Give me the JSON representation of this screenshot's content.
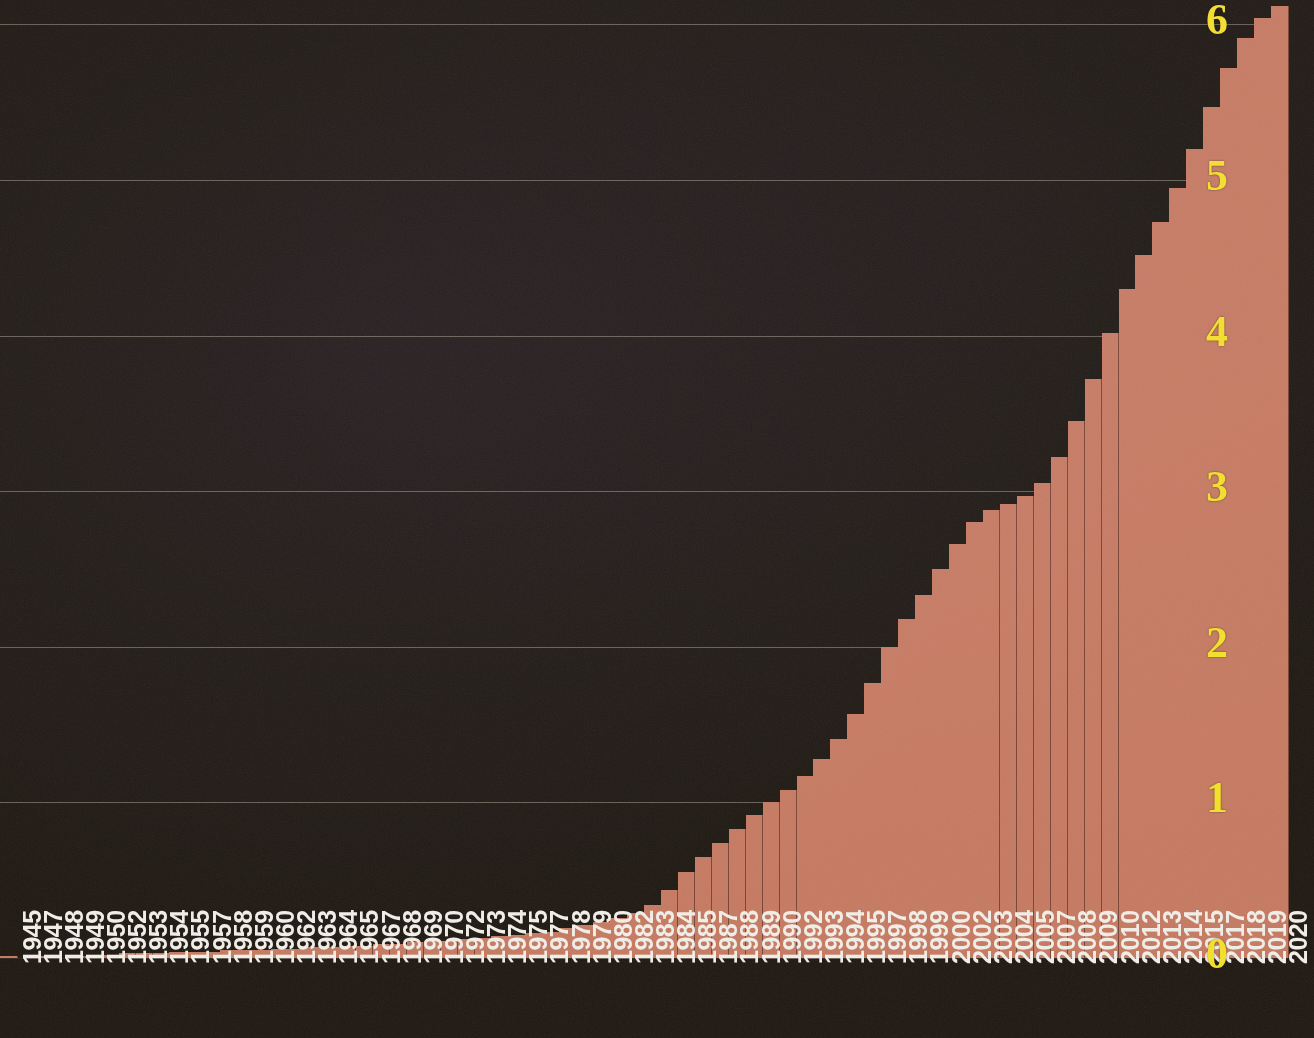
{
  "chart_data": {
    "type": "bar",
    "title": "",
    "subtitle": "",
    "xlabel": "",
    "ylabel": "",
    "ylim": [
      0,
      6.3
    ],
    "y_ticks": [
      0,
      1,
      2,
      3,
      4,
      5,
      6
    ],
    "y_tick_labels": [
      "0",
      "1",
      "2",
      "3",
      "4",
      "5",
      "6"
    ],
    "grid": true,
    "grid_axis": "y",
    "legend": "none",
    "bar_color": "#c67a61",
    "axis_label_color_y": "#f5e028",
    "axis_label_color_x": "#f2efe9",
    "background_color": "#1e1811",
    "x_tick_labels": [
      "1945",
      "1947",
      "1948",
      "1949",
      "1950",
      "1952",
      "1953",
      "1954",
      "1955",
      "1957",
      "1958",
      "1959",
      "1960",
      "1962",
      "1963",
      "1964",
      "1965",
      "1967",
      "1968",
      "1969",
      "1970",
      "1972",
      "1973",
      "1974",
      "1975",
      "1977",
      "1978",
      "1979",
      "1980",
      "1982",
      "1983",
      "1984",
      "1985",
      "1987",
      "1988",
      "1989",
      "1990",
      "1992",
      "1993",
      "1994",
      "1995",
      "1997",
      "1998",
      "1999",
      "2000",
      "2002",
      "2003",
      "2004",
      "2005",
      "2007",
      "2008",
      "2009",
      "2010",
      "2012",
      "2013",
      "2014",
      "2015",
      "2017",
      "2018",
      "2019",
      "2020"
    ],
    "categories": [
      "1945",
      "1946",
      "1947",
      "1948",
      "1949",
      "1950",
      "1951",
      "1952",
      "1953",
      "1954",
      "1955",
      "1956",
      "1957",
      "1958",
      "1959",
      "1960",
      "1961",
      "1962",
      "1963",
      "1964",
      "1965",
      "1966",
      "1967",
      "1968",
      "1969",
      "1970",
      "1971",
      "1972",
      "1973",
      "1974",
      "1975",
      "1976",
      "1977",
      "1978",
      "1979",
      "1980",
      "1981",
      "1982",
      "1983",
      "1984",
      "1985",
      "1986",
      "1987",
      "1988",
      "1989",
      "1990",
      "1991",
      "1992",
      "1993",
      "1994",
      "1995",
      "1996",
      "1997",
      "1998",
      "1999",
      "2000",
      "2001",
      "2002",
      "2003",
      "2004",
      "2005",
      "2006",
      "2007",
      "2008",
      "2009",
      "2010",
      "2011",
      "2012",
      "2013",
      "2014",
      "2015",
      "2016",
      "2017",
      "2018",
      "2019",
      "2020"
    ],
    "values": [
      0.01,
      0.0,
      0.01,
      0.0,
      0.01,
      0.01,
      0.02,
      0.03,
      0.03,
      0.03,
      0.04,
      0.04,
      0.04,
      0.05,
      0.05,
      0.05,
      0.06,
      0.06,
      0.07,
      0.07,
      0.08,
      0.08,
      0.09,
      0.09,
      0.1,
      0.11,
      0.11,
      0.12,
      0.13,
      0.14,
      0.15,
      0.16,
      0.17,
      0.19,
      0.21,
      0.23,
      0.26,
      0.29,
      0.34,
      0.44,
      0.55,
      0.65,
      0.74,
      0.83,
      0.92,
      1.0,
      1.08,
      1.17,
      1.28,
      1.41,
      1.57,
      1.77,
      2.0,
      2.18,
      2.33,
      2.5,
      2.66,
      2.8,
      2.88,
      2.92,
      2.97,
      3.05,
      3.22,
      3.45,
      3.72,
      4.02,
      4.3,
      4.52,
      4.73,
      4.95,
      5.2,
      5.47,
      5.72,
      5.91,
      6.04,
      6.12
    ]
  }
}
